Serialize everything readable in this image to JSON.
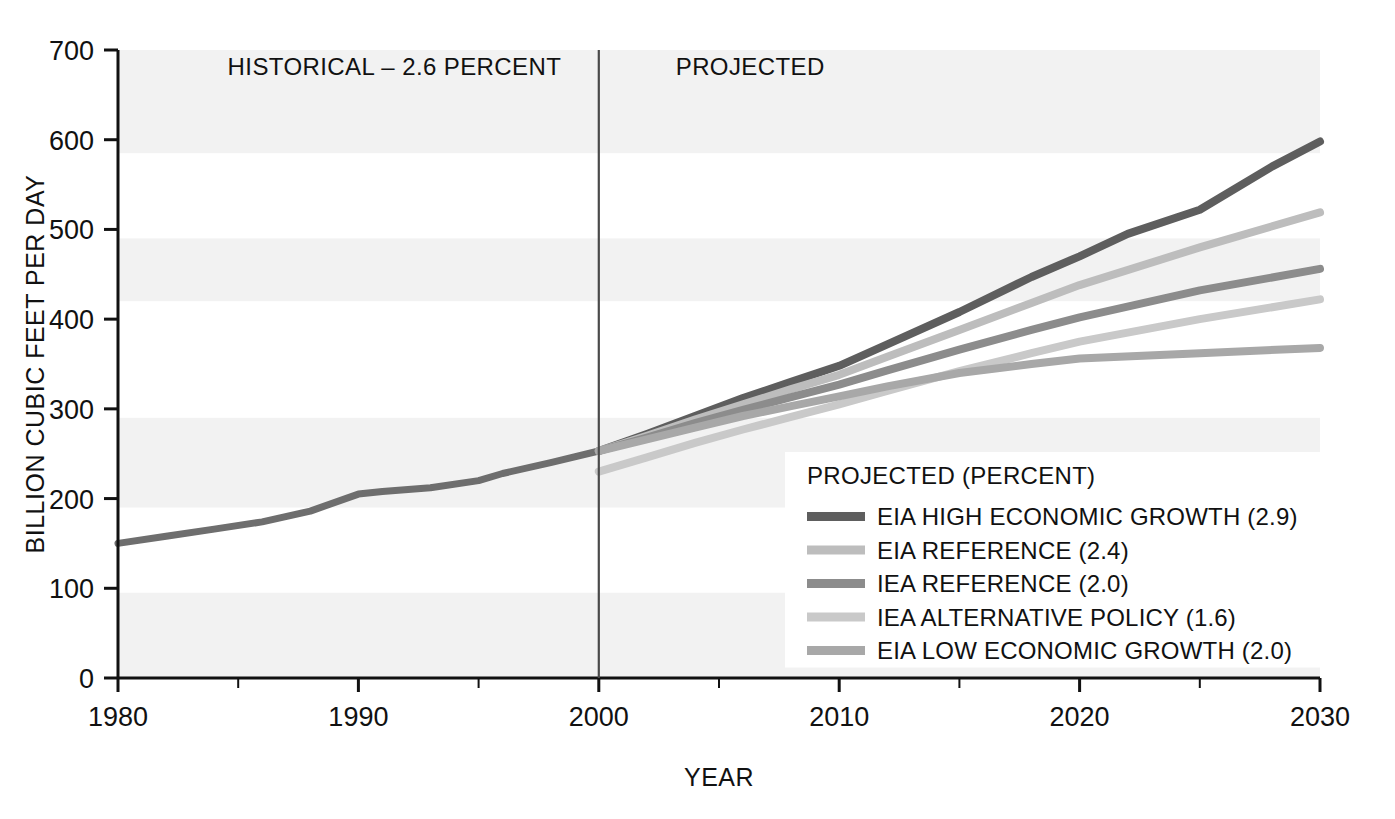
{
  "chart_data": {
    "type": "line",
    "title": "",
    "xlabel": "YEAR",
    "ylabel": "BILLION CUBIC FEET PER DAY",
    "xlim": [
      1980,
      2030
    ],
    "ylim": [
      0,
      700
    ],
    "ytick_labels": [
      "0",
      "100",
      "200",
      "300",
      "400",
      "500",
      "600",
      "700"
    ],
    "yticks": [
      0,
      100,
      200,
      300,
      400,
      500,
      600,
      700
    ],
    "xtick_labels": [
      "1980",
      "1990",
      "2000",
      "2010",
      "2020",
      "2030"
    ],
    "xticks": [
      1980,
      1990,
      2000,
      2010,
      2020,
      2030
    ],
    "xminor_ticks": [
      1985,
      1995,
      2005,
      2015,
      2025
    ],
    "grid": "horizontal-bands",
    "legend_position": "inside-bottom-right",
    "divider_year": 2000,
    "annotations": [
      {
        "text": "HISTORICAL – 2.6 PERCENT",
        "x": 1991.5,
        "y": 672,
        "align": "middle"
      },
      {
        "text": "PROJECTED",
        "x": 2003.2,
        "y": 672,
        "align": "start"
      }
    ],
    "series": [
      {
        "name": "HISTORICAL",
        "legend": false,
        "color": "#6e6e6e",
        "width": 7,
        "x": [
          1980,
          1982,
          1984,
          1986,
          1988,
          1990,
          1991,
          1993,
          1995,
          1996,
          1998,
          2000
        ],
        "values": [
          150,
          158,
          166,
          174,
          186,
          205,
          208,
          212,
          220,
          228,
          240,
          253
        ]
      },
      {
        "name": "EIA HIGH ECONOMIC GROWTH (2.9)",
        "legend": true,
        "color": "#5e5e5e",
        "width": 8,
        "x": [
          2000,
          2002,
          2004,
          2006,
          2008,
          2010,
          2012,
          2015,
          2018,
          2020,
          2022,
          2025,
          2028,
          2030
        ],
        "values": [
          253,
          272,
          292,
          312,
          330,
          348,
          372,
          408,
          447,
          470,
          495,
          522,
          570,
          598
        ]
      },
      {
        "name": "EIA REFERENCE (2.4)",
        "legend": true,
        "color": "#bdbdbd",
        "width": 8,
        "x": [
          2000,
          2002,
          2004,
          2006,
          2008,
          2010,
          2012,
          2015,
          2018,
          2020,
          2025,
          2030
        ],
        "values": [
          253,
          270,
          288,
          305,
          322,
          338,
          358,
          388,
          418,
          438,
          480,
          519
        ]
      },
      {
        "name": "IEA REFERENCE (2.0)",
        "legend": true,
        "color": "#8c8c8c",
        "width": 8,
        "x": [
          2000,
          2002,
          2004,
          2006,
          2008,
          2010,
          2012,
          2015,
          2018,
          2020,
          2025,
          2030
        ],
        "values": [
          253,
          268,
          284,
          299,
          313,
          327,
          343,
          366,
          388,
          402,
          432,
          456
        ]
      },
      {
        "name": "IEA ALTERNATIVE POLICY (1.6)",
        "legend": true,
        "color": "#c9c9c9",
        "width": 8,
        "x": [
          2000,
          2002,
          2004,
          2006,
          2008,
          2010,
          2012,
          2015,
          2018,
          2020,
          2025,
          2030
        ],
        "values": [
          230,
          246,
          262,
          277,
          291,
          305,
          320,
          342,
          362,
          375,
          400,
          422
        ]
      },
      {
        "name": "EIA LOW ECONOMIC GROWTH (2.0)",
        "legend": true,
        "color": "#a8a8a8",
        "width": 8,
        "x": [
          2000,
          2002,
          2004,
          2006,
          2008,
          2010,
          2012,
          2015,
          2018,
          2020,
          2025,
          2030
        ],
        "values": [
          253,
          266,
          279,
          292,
          303,
          314,
          325,
          340,
          350,
          356,
          362,
          368
        ]
      }
    ]
  },
  "legend": {
    "title": "PROJECTED (PERCENT)",
    "items": [
      {
        "label": "EIA HIGH ECONOMIC GROWTH (2.9)",
        "color": "#5e5e5e"
      },
      {
        "label": "EIA REFERENCE (2.4)",
        "color": "#bdbdbd"
      },
      {
        "label": "IEA REFERENCE (2.0)",
        "color": "#8c8c8c"
      },
      {
        "label": "IEA ALTERNATIVE POLICY (1.6)",
        "color": "#c9c9c9"
      },
      {
        "label": "EIA LOW ECONOMIC GROWTH (2.0)",
        "color": "#a8a8a8"
      }
    ]
  },
  "colors": {
    "axis": "#111111",
    "band": "#f2f2f2",
    "background": "#ffffff",
    "divider": "#4a4a4a"
  }
}
